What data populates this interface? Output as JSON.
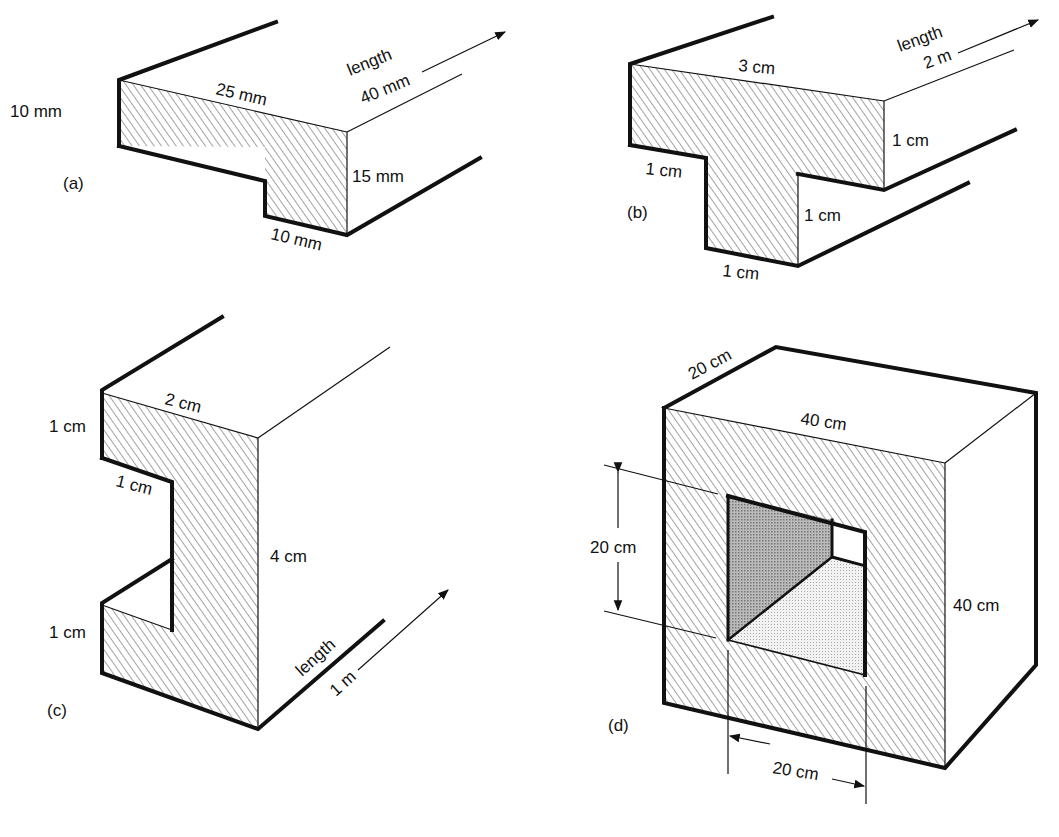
{
  "figures": [
    {
      "id": "a",
      "tag": "(a)",
      "labels": {
        "left": "10 mm",
        "top": "25 mm",
        "right": "15 mm",
        "bottom": "10 mm",
        "length_word": "length",
        "length_value": "40 mm"
      }
    },
    {
      "id": "b",
      "tag": "(b)",
      "labels": {
        "top": "3 cm",
        "right": "1 cm",
        "flange_under": "1 cm",
        "web_right": "1 cm",
        "bottom": "1 cm",
        "length_word": "length",
        "length_value": "2 m"
      }
    },
    {
      "id": "c",
      "tag": "(c)",
      "labels": {
        "top": "2 cm",
        "upper_left": "1 cm",
        "inner": "1 cm",
        "lower_left": "1 cm",
        "right": "4 cm",
        "length_word": "length",
        "length_value": "1 m"
      }
    },
    {
      "id": "d",
      "tag": "(d)",
      "labels": {
        "depth": "20 cm",
        "top": "40 cm",
        "right": "40 cm",
        "hole_height": "20 cm",
        "hole_width": "20 cm"
      }
    }
  ],
  "colors": {
    "ink": "#111111",
    "hatch": "#555555",
    "background": "#ffffff"
  }
}
